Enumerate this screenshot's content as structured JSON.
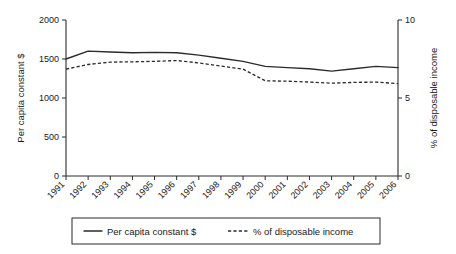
{
  "chart_data": {
    "type": "line",
    "title": "",
    "xlabel": "",
    "categories": [
      "1991",
      "1992",
      "1993",
      "1994",
      "1995",
      "1996",
      "1997",
      "1998",
      "1999",
      "2000",
      "2001",
      "2002",
      "2003",
      "2004",
      "2005",
      "2006"
    ],
    "grid": false,
    "legend_position": "bottom",
    "axes": {
      "left": {
        "label": "Per capita constant $",
        "ticks": [
          "0",
          "500",
          "1000",
          "1500",
          "2000"
        ],
        "tick_values": [
          0,
          500,
          1000,
          1500,
          2000
        ],
        "min": 0,
        "max": 2000
      },
      "right": {
        "label": "% of disposable income",
        "ticks": [
          "0",
          "5",
          "10"
        ],
        "tick_values": [
          0,
          5,
          10
        ],
        "min": 0,
        "max": 10
      }
    },
    "series": [
      {
        "name": "Per capita constant $",
        "axis": "left",
        "style": "solid",
        "color": "#2b2b2b",
        "values": [
          1500,
          1600,
          1590,
          1580,
          1585,
          1580,
          1550,
          1510,
          1470,
          1405,
          1390,
          1375,
          1345,
          1375,
          1405,
          1390
        ]
      },
      {
        "name": "% of disposable income",
        "axis": "right",
        "style": "dashed",
        "color": "#2b2b2b",
        "values": [
          6.85,
          7.15,
          7.3,
          7.32,
          7.35,
          7.4,
          7.25,
          7.05,
          6.85,
          6.1,
          6.08,
          6.02,
          5.95,
          6.0,
          6.02,
          5.92
        ]
      }
    ]
  },
  "legend": {
    "entries": [
      {
        "label": "Per capita constant $",
        "style": "solid"
      },
      {
        "label": "% of disposable income",
        "style": "dashed"
      }
    ]
  }
}
